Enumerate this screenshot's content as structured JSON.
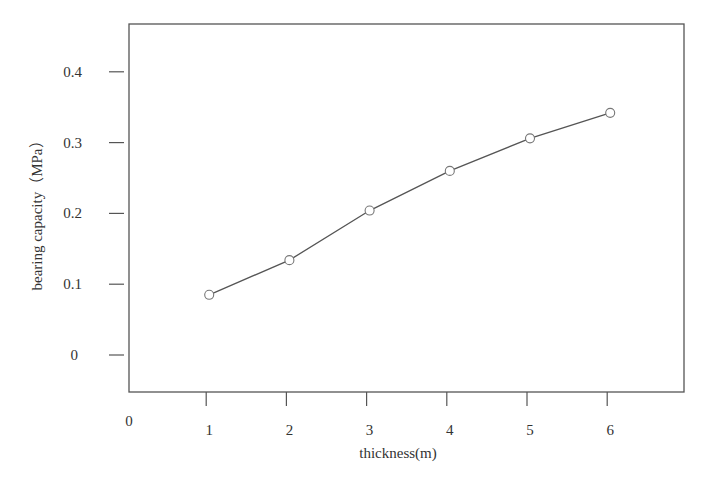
{
  "chart_data": {
    "type": "line",
    "title": "",
    "xlabel": "thickness(m)",
    "ylabel": "bearing capacity（MPa）",
    "x": [
      1,
      2,
      3,
      4,
      5,
      6
    ],
    "series": [
      {
        "name": "bearing capacity",
        "values": [
          0.085,
          0.134,
          0.204,
          0.26,
          0.306,
          0.342
        ],
        "marker": "open-circle"
      }
    ],
    "x_ticks": [
      "0",
      "1",
      "2",
      "3",
      "4",
      "5",
      "6"
    ],
    "y_ticks": [
      "0",
      "0.1",
      "0.2",
      "0.3",
      "0.4"
    ],
    "xlim": [
      0,
      7
    ],
    "ylim": [
      -0.05,
      0.47
    ],
    "grid": false,
    "legend": null
  },
  "colors": {
    "line": "#555555",
    "frame": "#555555",
    "text": "#333333"
  }
}
